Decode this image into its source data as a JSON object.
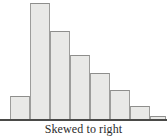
{
  "figure": {
    "caption": "Skewed to right",
    "background_color": "#ffffff",
    "axis_color": "#4a4a48",
    "bar_fill_color": "#e9e9e7",
    "bar_border_color": "#9d9d9b"
  },
  "chart_data": {
    "type": "bar",
    "title": "Skewed to right",
    "subtitle": "",
    "xlabel": "",
    "ylabel": "",
    "grid": false,
    "legend": false,
    "legend_position": "none",
    "orientation": "vertical",
    "axis_ranges": {
      "xlim": [
        0,
        8
      ],
      "ylim": [
        0,
        120
      ]
    },
    "tick_labels": {
      "x": [],
      "y": []
    },
    "categories": [
      "1",
      "2",
      "3",
      "4",
      "5",
      "6",
      "7",
      "8"
    ],
    "values": [
      24,
      117,
      89,
      65,
      47,
      30,
      14,
      4
    ],
    "bar_geometry": [
      {
        "index": 0,
        "x": 10,
        "width": 20,
        "top": 96,
        "height": 24
      },
      {
        "index": 1,
        "x": 30,
        "width": 20,
        "top": 3,
        "height": 117
      },
      {
        "index": 2,
        "x": 50,
        "width": 20,
        "top": 31,
        "height": 89
      },
      {
        "index": 3,
        "x": 70,
        "width": 20,
        "top": 55,
        "height": 65
      },
      {
        "index": 4,
        "x": 90,
        "width": 20,
        "top": 73,
        "height": 47
      },
      {
        "index": 5,
        "x": 110,
        "width": 20,
        "top": 90,
        "height": 30
      },
      {
        "index": 6,
        "x": 130,
        "width": 20,
        "top": 106,
        "height": 14
      },
      {
        "index": 7,
        "x": 150,
        "width": 16,
        "top": 116,
        "height": 4
      }
    ]
  }
}
